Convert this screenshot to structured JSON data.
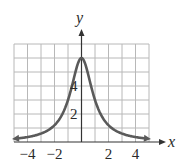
{
  "chart_data": {
    "type": "line",
    "title": "",
    "xlabel": "x",
    "ylabel": "y",
    "xlim": [
      -5,
      5
    ],
    "ylim": [
      0,
      7
    ],
    "grid": true,
    "x_tick_labels": [
      "−4",
      "−2",
      "2",
      "4"
    ],
    "x_tick_values": [
      -4,
      -2,
      2,
      4
    ],
    "y_tick_labels": [
      "2",
      "4"
    ],
    "y_tick_values": [
      2,
      4
    ],
    "series": [
      {
        "name": "y = 6/(1+x²)",
        "x": [
          -5,
          -4,
          -3,
          -2,
          -1.5,
          -1,
          -0.5,
          0,
          0.5,
          1,
          1.5,
          2,
          3,
          4,
          5
        ],
        "values": [
          0.23,
          0.35,
          0.6,
          1.2,
          1.85,
          3.0,
          4.8,
          6.0,
          4.8,
          3.0,
          1.85,
          1.2,
          0.6,
          0.35,
          0.23
        ],
        "arrows_both_ends": true
      }
    ],
    "colors": {
      "curve": "#5a5a5a",
      "grid": "#b8b8b8",
      "axis": "#333333"
    }
  }
}
